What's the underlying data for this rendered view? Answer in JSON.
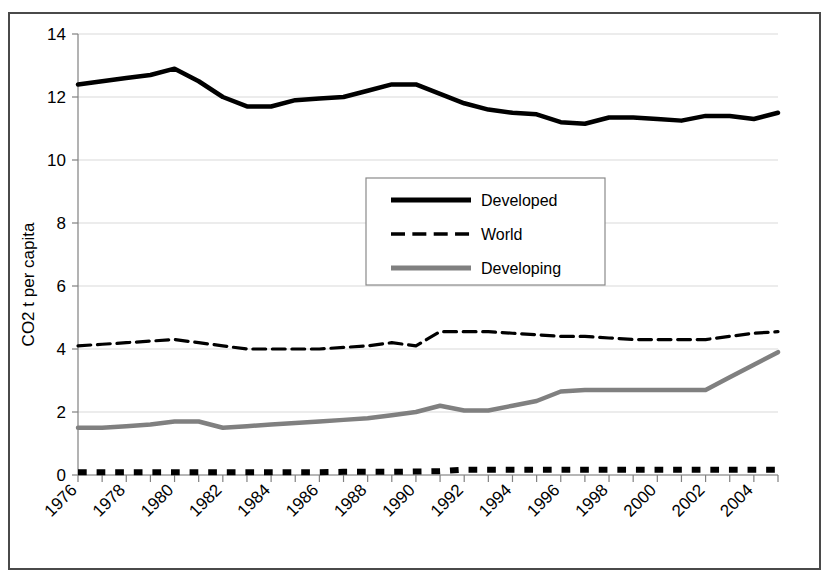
{
  "chart_data": {
    "type": "line",
    "title": "",
    "xlabel": "",
    "ylabel": "CO2 t per capita",
    "ylim": [
      0,
      14
    ],
    "yticks": [
      0,
      2,
      4,
      6,
      8,
      10,
      12,
      14
    ],
    "ytick_labels": [
      "0",
      "2",
      "4",
      "6",
      "8",
      "10",
      "12",
      "14"
    ],
    "grid": true,
    "grid_axis": "y",
    "legend_position": "center",
    "x": [
      1976,
      1977,
      1978,
      1979,
      1980,
      1981,
      1982,
      1983,
      1984,
      1985,
      1986,
      1987,
      1988,
      1989,
      1990,
      1991,
      1992,
      1993,
      1994,
      1995,
      1996,
      1997,
      1998,
      1999,
      2000,
      2001,
      2002,
      2003,
      2004,
      2005
    ],
    "xtick_labels": [
      "1976",
      "1978",
      "1980",
      "1982",
      "1984",
      "1986",
      "1988",
      "1990",
      "1992",
      "1994",
      "1996",
      "1998",
      "2000",
      "2002",
      "2004"
    ],
    "xtick_values": [
      1976,
      1978,
      1980,
      1982,
      1984,
      1986,
      1988,
      1990,
      1992,
      1994,
      1996,
      1998,
      2000,
      2002,
      2004
    ],
    "xtick_rotation": 45,
    "series": [
      {
        "name": "Developed",
        "style": "solid",
        "color": "#000000",
        "width": 4.5,
        "in_legend": true,
        "values": [
          12.4,
          12.5,
          12.6,
          12.7,
          12.9,
          12.5,
          12.0,
          11.7,
          11.7,
          11.9,
          11.95,
          12.0,
          12.2,
          12.4,
          12.4,
          12.1,
          11.8,
          11.6,
          11.5,
          11.45,
          11.2,
          11.15,
          11.35,
          11.35,
          11.3,
          11.25,
          11.4,
          11.4,
          11.3,
          11.5
        ]
      },
      {
        "name": "World",
        "style": "dashed",
        "color": "#000000",
        "width": 3.2,
        "in_legend": true,
        "values": [
          4.1,
          4.15,
          4.2,
          4.25,
          4.3,
          4.2,
          4.1,
          4.0,
          4.0,
          4.0,
          4.0,
          4.05,
          4.1,
          4.2,
          4.1,
          4.55,
          4.55,
          4.55,
          4.5,
          4.45,
          4.4,
          4.4,
          4.35,
          4.3,
          4.3,
          4.3,
          4.3,
          4.4,
          4.5,
          4.55
        ]
      },
      {
        "name": "Developing",
        "style": "solid",
        "color": "#808080",
        "width": 4.5,
        "in_legend": true,
        "values": [
          1.5,
          1.5,
          1.55,
          1.6,
          1.7,
          1.7,
          1.5,
          1.55,
          1.6,
          1.65,
          1.7,
          1.75,
          1.8,
          1.9,
          2.0,
          2.2,
          2.05,
          2.05,
          2.2,
          2.35,
          2.65,
          2.7,
          2.7,
          2.7,
          2.7,
          2.7,
          2.7,
          3.1,
          3.5,
          3.9
        ]
      },
      {
        "name": "",
        "style": "dotted",
        "color": "#000000",
        "width": 6,
        "in_legend": false,
        "values": [
          0.09,
          0.09,
          0.09,
          0.09,
          0.09,
          0.09,
          0.09,
          0.09,
          0.09,
          0.09,
          0.09,
          0.1,
          0.1,
          0.1,
          0.11,
          0.12,
          0.17,
          0.17,
          0.17,
          0.17,
          0.17,
          0.17,
          0.17,
          0.17,
          0.17,
          0.17,
          0.17,
          0.17,
          0.17,
          0.17
        ]
      }
    ],
    "legend_entries": [
      {
        "label": "Developed",
        "style": "solid",
        "color": "#000000",
        "width": 5
      },
      {
        "label": "World",
        "style": "dashed",
        "color": "#000000",
        "width": 3.5
      },
      {
        "label": "Developing",
        "style": "solid",
        "color": "#808080",
        "width": 5
      }
    ]
  },
  "layout": {
    "plot_left": 78,
    "plot_right": 778,
    "plot_top": 34,
    "plot_bottom": 475,
    "legend_x": 366,
    "legend_y": 178,
    "legend_w": 239,
    "legend_h": 107
  },
  "colors": {
    "frame": "#4a4a4a",
    "grid": "#d9d9d9",
    "axis": "#808080",
    "developed": "#000000",
    "world": "#000000",
    "developing": "#808080"
  }
}
